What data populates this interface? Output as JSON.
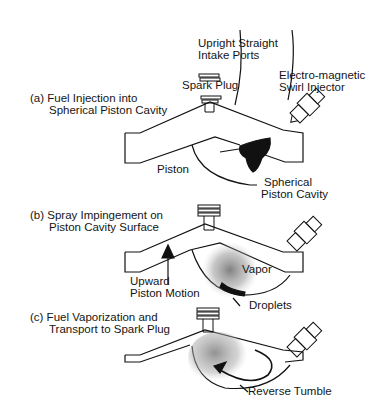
{
  "diagram": {
    "type": "engine-combustion-stages",
    "panels": [
      {
        "id": "a",
        "caption_line1": "(a) Fuel Injection into",
        "caption_line2": "Spherical Piston Cavity",
        "callouts": {
          "intake_line1": "Upright Straight",
          "intake_line2": "Intake Ports",
          "spark_plug": "Spark Plug",
          "injector_line1": "Electro-magnetic",
          "injector_line2": "Swirl Injector",
          "piston": "Piston",
          "cavity_line1": "Spherical",
          "cavity_line2": "Piston Cavity"
        }
      },
      {
        "id": "b",
        "caption_line1": "(b) Spray Impingement on",
        "caption_line2": "Piston Cavity Surface",
        "callouts": {
          "motion_line1": "Upward",
          "motion_line2": "Piston Motion",
          "vapor": "Vapor",
          "droplets": "Droplets"
        }
      },
      {
        "id": "c",
        "caption_line1": "(c) Fuel Vaporization and",
        "caption_line2": "Transport to Spark Plug",
        "callouts": {
          "tumble": "Reverse Tumble"
        }
      }
    ]
  }
}
